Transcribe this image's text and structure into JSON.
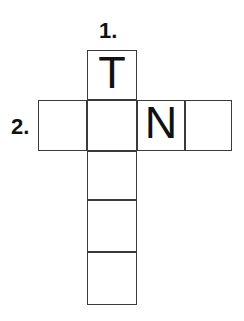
{
  "puzzle": {
    "type": "crossword-grid",
    "background_color": "#ffffff",
    "cell_border_color": "#3a3a3a",
    "text_color": "#111111",
    "cell_size": 50,
    "clues": [
      {
        "id": "clue-1",
        "label": "1.",
        "direction": "down",
        "x": 99,
        "y": 20
      },
      {
        "id": "clue-2",
        "label": "2.",
        "direction": "across",
        "x": 11,
        "y": 116
      }
    ],
    "cells": [
      {
        "id": "cell-down-1",
        "letter": "T",
        "x": 87,
        "y": 50,
        "w": 50,
        "h": 50
      },
      {
        "id": "cell-across-1",
        "letter": "",
        "x": 38,
        "y": 100,
        "w": 49,
        "h": 51
      },
      {
        "id": "cell-across-2",
        "letter": "",
        "x": 87,
        "y": 100,
        "w": 50,
        "h": 51
      },
      {
        "id": "cell-across-3",
        "letter": "N",
        "x": 137,
        "y": 100,
        "w": 48,
        "h": 51
      },
      {
        "id": "cell-across-4",
        "letter": "",
        "x": 185,
        "y": 100,
        "w": 47,
        "h": 51
      },
      {
        "id": "cell-down-3",
        "letter": "",
        "x": 87,
        "y": 151,
        "w": 50,
        "h": 49
      },
      {
        "id": "cell-down-4",
        "letter": "",
        "x": 87,
        "y": 200,
        "w": 50,
        "h": 52
      },
      {
        "id": "cell-down-5",
        "letter": "",
        "x": 87,
        "y": 252,
        "w": 50,
        "h": 53
      }
    ]
  }
}
